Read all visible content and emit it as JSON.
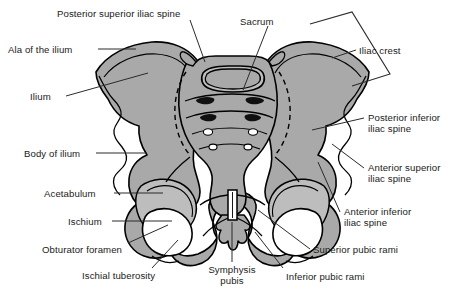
{
  "figure": {
    "width": 465,
    "height": 302,
    "background_color": "#ffffff"
  },
  "colors": {
    "bone_fill": "#a9a9a9",
    "bone_fill_light": "#bdbdbd",
    "cavity_white": "#ffffff",
    "outline": "#000000",
    "foramen_dark": "#101010",
    "label_text": "#1a1a1a",
    "leader_line": "#2b2b2b"
  },
  "labels": [
    {
      "id": "posterior-superior-iliac-spine",
      "text": "Posterior superior iliac spine",
      "align": "left",
      "x": 57,
      "y": 8
    },
    {
      "id": "sacrum",
      "text": "Sacrum",
      "align": "left",
      "x": 240,
      "y": 16
    },
    {
      "id": "iliac-crest",
      "text": "Iliac crest",
      "align": "left",
      "x": 359,
      "y": 45
    },
    {
      "id": "ala-of-the-ilium",
      "text": "Ala of the ilium",
      "align": "left",
      "x": 8,
      "y": 44
    },
    {
      "id": "ilium",
      "text": "Ilium",
      "align": "left",
      "x": 30,
      "y": 93
    },
    {
      "id": "posterior-inferior-iliac-spine",
      "text": "Posterior inferior\niliac spine",
      "align": "left",
      "x": 368,
      "y": 113
    },
    {
      "id": "body-of-ilium",
      "text": "Body of ilium",
      "align": "left",
      "x": 24,
      "y": 148
    },
    {
      "id": "anterior-superior-iliac-spine",
      "text": "Anterior superior\niliac spine",
      "align": "left",
      "x": 368,
      "y": 163
    },
    {
      "id": "acetabulum",
      "text": "Acetabulum",
      "align": "left",
      "x": 44,
      "y": 188
    },
    {
      "id": "anterior-inferior-iliac-spine",
      "text": "Anterior inferior\niliac spine",
      "align": "left",
      "x": 344,
      "y": 207
    },
    {
      "id": "ischium",
      "text": "Ischium",
      "align": "left",
      "x": 68,
      "y": 216
    },
    {
      "id": "superior-pubic-rami",
      "text": "Superior pubic rami",
      "align": "left",
      "x": 313,
      "y": 245
    },
    {
      "id": "obturator-foramen",
      "text": "Obturator foramen",
      "align": "left",
      "x": 42,
      "y": 245
    },
    {
      "id": "ischial-tuberosity",
      "text": "Ischial tuberosity",
      "align": "left",
      "x": 82,
      "y": 271
    },
    {
      "id": "symphysis-pubis",
      "text": "Symphysis\npubis",
      "align": "center",
      "x": 196,
      "y": 265
    },
    {
      "id": "inferior-pubic-rami",
      "text": "Inferior pubic rami",
      "align": "left",
      "x": 286,
      "y": 272
    }
  ],
  "structures": [
    {
      "id": "sacrum-body",
      "name": "Sacrum"
    },
    {
      "id": "sacral-promontory",
      "name": "Sacral promontory"
    },
    {
      "id": "coccyx",
      "name": "Coccyx"
    },
    {
      "id": "left-hip-bone",
      "name": "Left hip bone"
    },
    {
      "id": "right-hip-bone",
      "name": "Right hip bone"
    },
    {
      "id": "left-obturator-foramen",
      "name": "Left obturator foramen"
    },
    {
      "id": "right-obturator-foramen",
      "name": "Right obturator foramen"
    },
    {
      "id": "pubic-symphysis-joint",
      "name": "Pubic symphysis joint"
    },
    {
      "id": "sacral-foramina",
      "name": "Anterior sacral foramina"
    }
  ]
}
